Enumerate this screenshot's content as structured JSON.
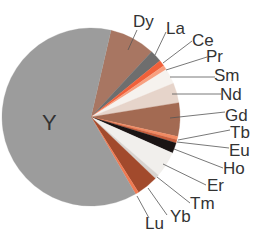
{
  "chart_data": {
    "type": "pie",
    "title": "",
    "start_angle_deg_clockwise_from_top": 13,
    "units": "percent (estimated from slice angles)",
    "slices": [
      {
        "label": "Dy",
        "value": 8.3,
        "color": "#a87662"
      },
      {
        "label": "La",
        "value": 2.2,
        "color": "#6e6e6e"
      },
      {
        "label": "Ce",
        "value": 1.1,
        "color": "#f0603a"
      },
      {
        "label": "Pr",
        "value": 0.8,
        "color": "#f7a080"
      },
      {
        "label": "Sm",
        "value": 2.8,
        "color": "#f6f2ee"
      },
      {
        "label": "Nd",
        "value": 3.6,
        "color": "#e6d4ca"
      },
      {
        "label": "Gd",
        "value": 6.1,
        "color": "#a36a52"
      },
      {
        "label": "Tb",
        "value": 0.6,
        "color": "#f28a62"
      },
      {
        "label": "Eu",
        "value": 0.6,
        "color": "#c85f3e"
      },
      {
        "label": "Ho",
        "value": 1.9,
        "color": "#1a1414"
      },
      {
        "label": "Er",
        "value": 4.7,
        "color": "#f1efec"
      },
      {
        "label": "Tm",
        "value": 0.8,
        "color": "#d8d4d0"
      },
      {
        "label": "Yb",
        "value": 3.9,
        "color": "#a24a2c"
      },
      {
        "label": "Lu",
        "value": 0.6,
        "color": "#f07a52"
      },
      {
        "label": "Y",
        "value": 61.9,
        "color": "#9c9c9c"
      }
    ],
    "labels_right": [
      {
        "label": "Dy",
        "x": 133,
        "y": 27,
        "anchor_x": 128,
        "anchor_y": 50,
        "line_to_x": 137,
        "line_to_y": 30
      },
      {
        "label": "La",
        "x": 166,
        "y": 34,
        "anchor_x": 155,
        "anchor_y": 55,
        "line_to_x": 166,
        "line_to_y": 32
      },
      {
        "label": "Ce",
        "x": 192,
        "y": 46,
        "anchor_x": 163,
        "anchor_y": 63,
        "line_to_x": 192,
        "line_to_y": 41
      },
      {
        "label": "Pr",
        "x": 206,
        "y": 62,
        "anchor_x": 166,
        "anchor_y": 70,
        "line_to_x": 207,
        "line_to_y": 57
      },
      {
        "label": "Sm",
        "x": 214,
        "y": 81,
        "anchor_x": 170,
        "anchor_y": 77,
        "line_to_x": 215,
        "line_to_y": 77
      },
      {
        "label": "Nd",
        "x": 220,
        "y": 100,
        "anchor_x": 172,
        "anchor_y": 94,
        "line_to_x": 221,
        "line_to_y": 94
      },
      {
        "label": "Gd",
        "x": 225,
        "y": 121,
        "anchor_x": 170,
        "anchor_y": 118,
        "line_to_x": 225,
        "line_to_y": 112
      },
      {
        "label": "Tb",
        "x": 230,
        "y": 138,
        "anchor_x": 178,
        "anchor_y": 140,
        "line_to_x": 230,
        "line_to_y": 130
      },
      {
        "label": "Eu",
        "x": 229,
        "y": 156,
        "anchor_x": 177,
        "anchor_y": 142,
        "line_to_x": 229,
        "line_to_y": 148
      },
      {
        "label": "Ho",
        "x": 223,
        "y": 174,
        "anchor_x": 174,
        "anchor_y": 149,
        "line_to_x": 223,
        "line_to_y": 168
      },
      {
        "label": "Er",
        "x": 207,
        "y": 191,
        "anchor_x": 163,
        "anchor_y": 164,
        "line_to_x": 206,
        "line_to_y": 185
      },
      {
        "label": "Tm",
        "x": 190,
        "y": 209,
        "anchor_x": 157,
        "anchor_y": 177,
        "line_to_x": 190,
        "line_to_y": 203
      },
      {
        "label": "Yb",
        "x": 170,
        "y": 222,
        "anchor_x": 148,
        "anchor_y": 188,
        "line_to_x": 167,
        "line_to_y": 215
      },
      {
        "label": "Lu",
        "x": 145,
        "y": 229,
        "anchor_x": 137,
        "anchor_y": 196,
        "line_to_x": 149,
        "line_to_y": 218
      }
    ],
    "label_inside": {
      "label": "Y",
      "x": 42,
      "y": 130
    },
    "geometry": {
      "cx": 91,
      "cy": 117,
      "r": 89
    },
    "legend": "none (direct leader-line labels)",
    "grid": false
  }
}
